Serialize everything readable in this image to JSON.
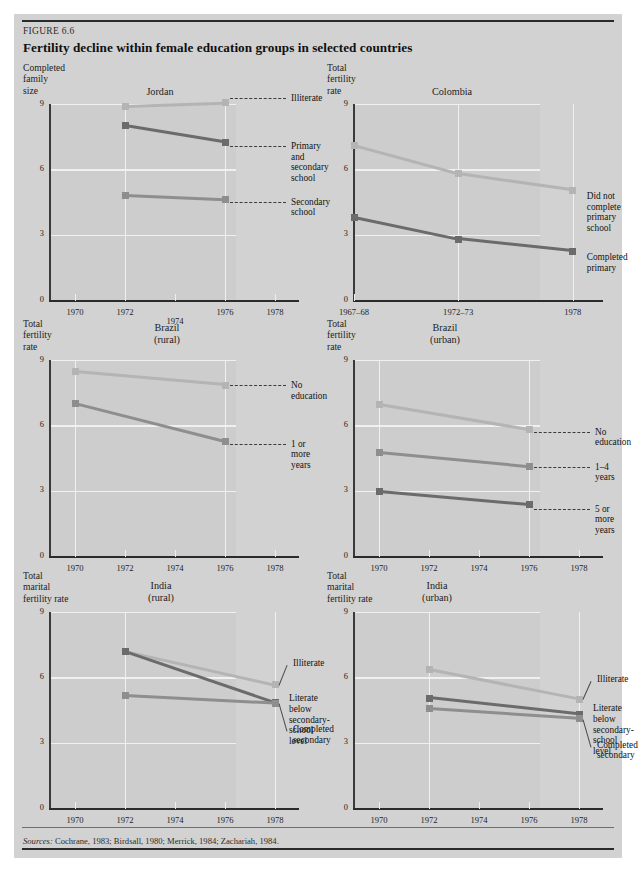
{
  "figure": {
    "number": "FIGURE 6.6",
    "title": "Fertility decline within female education groups in selected countries",
    "source_lead": "Sources:",
    "source_text": " Cochrane, 1983; Birdsall, 1980; Merrick, 1984; Zachariah, 1984."
  },
  "palette": {
    "panel_background": "#d2d2d2",
    "plot_background": "#cdcdcd",
    "gridline": "#f0f0f0",
    "axis": "#2b2b2b",
    "series_light": "#b4b4b4",
    "series_mid": "#8e8e8e",
    "series_dark": "#6b6b6b"
  },
  "chart_data": [
    {
      "id": "jordan",
      "type": "line",
      "title": "Jordan",
      "ylabel": "Completed\nfamily\nsize",
      "xlabel": "",
      "ylim": [
        0,
        9
      ],
      "yticks": [
        0,
        3,
        6,
        9
      ],
      "ytick_labels": [
        "0",
        "3",
        "6",
        "9"
      ],
      "xlim": [
        1969,
        1979
      ],
      "xticks": [
        1970,
        1972,
        1974,
        1976,
        1978
      ],
      "xtick_labels": [
        "1970",
        "1972",
        "1974",
        "1976",
        "1978"
      ],
      "gridlines_x": [
        1972,
        1976
      ],
      "grid": true,
      "legend_position": "right-inline",
      "series": [
        {
          "name": "Illiterate",
          "color": "#b4b4b4",
          "x": [
            1972,
            1976
          ],
          "values": [
            8.9,
            9.05
          ]
        },
        {
          "name": "Primary and\nsecondary school",
          "color": "#6b6b6b",
          "x": [
            1972,
            1976
          ],
          "values": [
            8.0,
            7.25
          ]
        },
        {
          "name": "Secondary\nschool",
          "color": "#8e8e8e",
          "x": [
            1972,
            1976
          ],
          "values": [
            4.8,
            4.6
          ]
        }
      ]
    },
    {
      "id": "colombia",
      "type": "line",
      "title": "Colombia",
      "ylabel": "Total\nfertility\nrate",
      "xlabel": "",
      "ylim": [
        0,
        9
      ],
      "yticks": [
        0,
        3,
        6,
        9
      ],
      "ytick_labels": [
        "0",
        "3",
        "6",
        "9"
      ],
      "xlim": [
        1967.5,
        1979.5
      ],
      "xticks": [
        1967.5,
        1972.5,
        1978
      ],
      "xtick_labels": [
        "1967–68",
        "1972–73",
        "1978"
      ],
      "gridlines_x": [
        1972.5,
        1978
      ],
      "grid": true,
      "legend_position": "right-inline",
      "series": [
        {
          "name": "Did not complete\nprimary school",
          "color": "#b4b4b4",
          "x": [
            1967.5,
            1972.5,
            1978
          ],
          "values": [
            7.1,
            5.8,
            5.05
          ]
        },
        {
          "name": "Completed\nprimary",
          "color": "#6b6b6b",
          "x": [
            1967.5,
            1972.5,
            1978
          ],
          "values": [
            3.8,
            2.8,
            2.25
          ]
        }
      ]
    },
    {
      "id": "brazil-rural",
      "type": "line",
      "title": "Brazil\n(rural)",
      "ylabel": "Total\nfertility\nrate",
      "xlabel": "",
      "ylim": [
        0,
        9
      ],
      "yticks": [
        0,
        3,
        6,
        9
      ],
      "ytick_labels": [
        "0",
        "3",
        "6",
        "9"
      ],
      "xlim": [
        1969,
        1979
      ],
      "xticks": [
        1970,
        1972,
        1974,
        1976,
        1978
      ],
      "xtick_labels": [
        "1970",
        "1972",
        "1974",
        "1976",
        "1978"
      ],
      "gridlines_x": [
        1970,
        1976
      ],
      "grid": true,
      "legend_position": "right-inline",
      "series": [
        {
          "name": "No education",
          "color": "#b4b4b4",
          "x": [
            1970,
            1976
          ],
          "values": [
            8.45,
            7.85
          ]
        },
        {
          "name": "1 or more\nyears",
          "color": "#8e8e8e",
          "x": [
            1970,
            1976
          ],
          "values": [
            7.0,
            5.25
          ]
        }
      ]
    },
    {
      "id": "brazil-urban",
      "type": "line",
      "title": "Brazil\n(urban)",
      "ylabel": "Total\nfertility\nrate",
      "xlabel": "",
      "ylim": [
        0,
        9
      ],
      "yticks": [
        0,
        3,
        6,
        9
      ],
      "ytick_labels": [
        "0",
        "3",
        "6",
        "9"
      ],
      "xlim": [
        1969,
        1979
      ],
      "xticks": [
        1970,
        1972,
        1974,
        1976,
        1978
      ],
      "xtick_labels": [
        "1970",
        "1972",
        "1974",
        "1976",
        "1978"
      ],
      "gridlines_x": [
        1970,
        1976
      ],
      "grid": true,
      "legend_position": "right-inline",
      "series": [
        {
          "name": "No education",
          "color": "#b4b4b4",
          "x": [
            1970,
            1976
          ],
          "values": [
            6.95,
            5.8
          ]
        },
        {
          "name": "1–4 years",
          "color": "#8e8e8e",
          "x": [
            1970,
            1976
          ],
          "values": [
            4.75,
            4.1
          ]
        },
        {
          "name": "5 or more\nyears",
          "color": "#6b6b6b",
          "x": [
            1970,
            1976
          ],
          "values": [
            2.95,
            2.35
          ]
        }
      ]
    },
    {
      "id": "india-rural",
      "type": "line",
      "title": "India\n(rural)",
      "ylabel": "Total\nmarital\nfertility rate",
      "xlabel": "",
      "ylim": [
        0,
        9
      ],
      "yticks": [
        0,
        3,
        6,
        9
      ],
      "ytick_labels": [
        "0",
        "3",
        "6",
        "9"
      ],
      "xlim": [
        1969,
        1979
      ],
      "xticks": [
        1970,
        1972,
        1974,
        1976,
        1978
      ],
      "xtick_labels": [
        "1970",
        "1972",
        "1974",
        "1976",
        "1978"
      ],
      "gridlines_x": [
        1972,
        1978
      ],
      "grid": true,
      "legend_position": "right-inline",
      "series": [
        {
          "name": "Illiterate",
          "color": "#b4b4b4",
          "x": [
            1972,
            1978
          ],
          "values": [
            7.2,
            5.65
          ]
        },
        {
          "name": "Literate below\nsecondary-school\nlevel",
          "color": "#6b6b6b",
          "x": [
            1972,
            1978
          ],
          "values": [
            7.2,
            4.85
          ]
        },
        {
          "name": "Completed\nsecondary",
          "color": "#8e8e8e",
          "x": [
            1972,
            1978
          ],
          "values": [
            5.15,
            4.8
          ]
        }
      ]
    },
    {
      "id": "india-urban",
      "type": "line",
      "title": "India\n(urban)",
      "ylabel": "Total\nmarital\nfertility rate",
      "xlabel": "",
      "ylim": [
        0,
        9
      ],
      "yticks": [
        0,
        3,
        6,
        9
      ],
      "ytick_labels": [
        "0",
        "3",
        "6",
        "9"
      ],
      "xlim": [
        1969,
        1979
      ],
      "xticks": [
        1970,
        1972,
        1974,
        1976,
        1978
      ],
      "xtick_labels": [
        "1970",
        "1972",
        "1974",
        "1976",
        "1978"
      ],
      "gridlines_x": [
        1972,
        1978
      ],
      "grid": true,
      "legend_position": "right-inline",
      "series": [
        {
          "name": "Illiterate",
          "color": "#b4b4b4",
          "x": [
            1972,
            1978
          ],
          "values": [
            6.35,
            5.0
          ]
        },
        {
          "name": "Literate below\nsecondary-school\nlevel",
          "color": "#6b6b6b",
          "x": [
            1972,
            1978
          ],
          "values": [
            5.05,
            4.3
          ]
        },
        {
          "name": "Completed\nsecondary",
          "color": "#8e8e8e",
          "x": [
            1972,
            1978
          ],
          "values": [
            4.55,
            4.1
          ]
        }
      ]
    }
  ],
  "chart_layout": {
    "jordan": {
      "name_left": 86,
      "name_top": 26,
      "name_width": 120,
      "labels": [
        {
          "idx": 0,
          "top": -5,
          "type": "dash"
        },
        {
          "idx": 1,
          "top": 4,
          "type": "dash"
        },
        {
          "idx": 2,
          "top": 2,
          "type": "dash"
        }
      ]
    },
    "colombia": {
      "name_left": 74,
      "name_top": 26,
      "name_width": 120,
      "labels": [
        {
          "idx": 0,
          "top": 6,
          "type": "plain"
        },
        {
          "idx": 1,
          "top": 6,
          "type": "plain"
        }
      ]
    },
    "brazil-rural": {
      "name_left": 98,
      "name_top": 6,
      "name_width": 110,
      "labels": [
        {
          "idx": 0,
          "top": 0,
          "type": "dash"
        },
        {
          "idx": 1,
          "top": 2,
          "type": "dash"
        }
      ]
    },
    "brazil-urban": {
      "name_left": 72,
      "name_top": 6,
      "name_width": 110,
      "labels": [
        {
          "idx": 0,
          "top": 2,
          "type": "dash"
        },
        {
          "idx": 1,
          "top": 0,
          "type": "dash"
        },
        {
          "idx": 2,
          "top": 4,
          "type": "dash"
        }
      ]
    },
    "india-rural": {
      "name_left": 92,
      "name_top": 12,
      "name_width": 110,
      "labels": [
        {
          "idx": 0,
          "top": -22,
          "type": "diag"
        },
        {
          "idx": 1,
          "top": -4,
          "type": "plain"
        },
        {
          "idx": 2,
          "top": 26,
          "type": "diag"
        }
      ]
    },
    "india-urban": {
      "name_left": 64,
      "name_top": 12,
      "name_width": 110,
      "labels": [
        {
          "idx": 0,
          "top": -20,
          "type": "diag"
        },
        {
          "idx": 1,
          "top": -6,
          "type": "plain"
        },
        {
          "idx": 2,
          "top": 26,
          "type": "diag"
        }
      ]
    }
  }
}
